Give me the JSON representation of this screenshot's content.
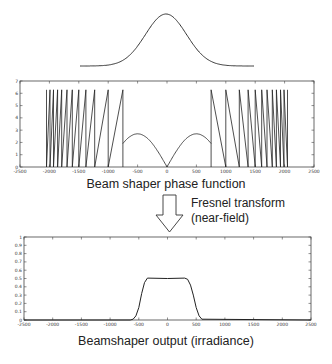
{
  "figure": {
    "input_beam_label": "",
    "phase_caption": "Beam shaper phase function",
    "transform_caption_line1": "Fresnel transform",
    "transform_caption_line2": "(near-field)",
    "output_caption": "Beamshaper output (irradiance)"
  },
  "chart_data": [
    {
      "type": "line",
      "title": "Input Gaussian beam",
      "xlabel": "",
      "ylabel": "",
      "axes": false,
      "series": [
        {
          "name": "gaussian",
          "shape": "gaussian",
          "center": 0,
          "relative_width": 0.12
        }
      ]
    },
    {
      "type": "line",
      "title": "Beam shaper phase function",
      "xlabel": "",
      "ylabel": "",
      "xlim": [
        -2500,
        2500
      ],
      "ylim": [
        0,
        7
      ],
      "xticks": [
        -2500,
        -2000,
        -1500,
        -1000,
        -500,
        0,
        500,
        1000,
        1500,
        2000,
        2500
      ],
      "yticks": [
        0,
        1,
        2,
        3,
        4,
        5,
        6,
        7
      ],
      "grid": false,
      "series": [
        {
          "name": "central arches",
          "x": [
            -750,
            -500,
            0,
            500,
            750
          ],
          "y": [
            0,
            2.7,
            0,
            2.7,
            0
          ]
        },
        {
          "name": "wrapped phase (mod 2π)",
          "max": 6.28,
          "region": "|x| from 750 to 2050",
          "wrap_positions_left": [
            -2050,
            -1990,
            -1930,
            -1860,
            -1790,
            -1700,
            -1610,
            -1500,
            -1380,
            -1230,
            -1000,
            -750
          ],
          "wrap_positions_right": [
            750,
            1000,
            1230,
            1380,
            1500,
            1610,
            1700,
            1790,
            1860,
            1930,
            1990,
            2050
          ]
        }
      ]
    },
    {
      "type": "line",
      "title": "Beamshaper output (irradiance)",
      "xlabel": "",
      "ylabel": "",
      "xlim": [
        -2500,
        2500
      ],
      "ylim": [
        0,
        1
      ],
      "xticks": [
        -2500,
        -2000,
        -1500,
        -1000,
        -500,
        0,
        500,
        1000,
        1500,
        2000,
        2500
      ],
      "yticks": [
        0,
        0.1,
        0.2,
        0.3,
        0.4,
        0.5,
        0.6,
        0.7,
        0.8,
        0.9,
        1
      ],
      "grid": false,
      "series": [
        {
          "name": "irradiance",
          "x": [
            -2500,
            -650,
            -600,
            -550,
            -500,
            -450,
            -400,
            -350,
            0,
            300,
            350,
            400,
            450,
            500,
            550,
            600,
            2500
          ],
          "y": [
            0,
            0,
            0.01,
            0.05,
            0.15,
            0.32,
            0.45,
            0.505,
            0.5,
            0.505,
            0.49,
            0.42,
            0.3,
            0.15,
            0.05,
            0.01,
            0
          ]
        }
      ]
    }
  ]
}
